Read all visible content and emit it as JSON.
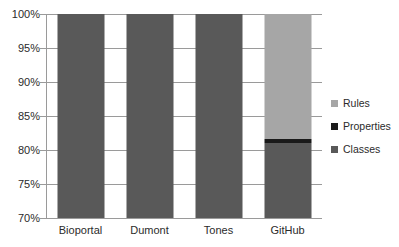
{
  "chart_data": {
    "type": "bar",
    "subtype": "stacked-bar",
    "title": "",
    "xlabel": "",
    "ylabel": "",
    "categories": [
      "Bioportal",
      "Dumont",
      "Tones",
      "GitHub"
    ],
    "series": [
      {
        "name": "Classes",
        "color": "#595959",
        "values": [
          100,
          100,
          100,
          81
        ]
      },
      {
        "name": "Properties",
        "color": "#1a1a1a",
        "values": [
          0,
          0,
          0,
          0.6
        ]
      },
      {
        "name": "Rules",
        "color": "#a6a6a6",
        "values": [
          0,
          0,
          0,
          18.4
        ]
      }
    ],
    "ylim": [
      70,
      100
    ],
    "yticks": [
      70,
      75,
      80,
      85,
      90,
      95,
      100
    ],
    "ytick_labels": [
      "70%",
      "75%",
      "80%",
      "85%",
      "90%",
      "95%",
      "100%"
    ],
    "grid": true,
    "legend_position": "right",
    "legend_order": [
      "Rules",
      "Properties",
      "Classes"
    ]
  },
  "axis": {
    "y_ticks": [
      {
        "label": "100%",
        "value": 100
      },
      {
        "label": "95%",
        "value": 95
      },
      {
        "label": "90%",
        "value": 90
      },
      {
        "label": "85%",
        "value": 85
      },
      {
        "label": "80%",
        "value": 80
      },
      {
        "label": "75%",
        "value": 75
      },
      {
        "label": "70%",
        "value": 70
      }
    ],
    "x_categories": [
      "Bioportal",
      "Dumont",
      "Tones",
      "GitHub"
    ]
  },
  "legend": {
    "items": [
      {
        "label": "Rules",
        "color": "#a6a6a6"
      },
      {
        "label": "Properties",
        "color": "#1a1a1a"
      },
      {
        "label": "Classes",
        "color": "#595959"
      }
    ]
  },
  "colors": {
    "classes": "#595959",
    "properties": "#1a1a1a",
    "rules": "#a6a6a6",
    "gridline": "#9a9a9a",
    "text": "#2b2b2b",
    "background": "#ffffff"
  }
}
